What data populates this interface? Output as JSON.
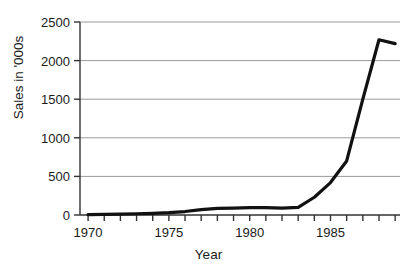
{
  "chart_data": {
    "type": "line",
    "title": "",
    "xlabel": "Year",
    "ylabel": "Sales in '000s",
    "xlim": [
      1969.5,
      1989.3
    ],
    "ylim": [
      0,
      2500
    ],
    "grid": true,
    "legend": false,
    "y_ticks": [
      0,
      500,
      1000,
      1500,
      2000,
      2500
    ],
    "y_tick_labels": [
      "0",
      "500",
      "1000",
      "1500",
      "2000",
      "2500"
    ],
    "x_ticks": [
      1970,
      1971,
      1972,
      1973,
      1974,
      1975,
      1976,
      1977,
      1978,
      1979,
      1980,
      1981,
      1982,
      1983,
      1984,
      1985,
      1986,
      1987,
      1988,
      1989
    ],
    "x_tick_labels_shown": [
      "1970",
      "1975",
      "1980",
      "1985"
    ],
    "x_tick_labels_shown_at": [
      1970,
      1975,
      1980,
      1985
    ],
    "line_color": "#111111",
    "line_width": 3.2,
    "grid_color": "#9a9a9a",
    "axis_color": "#333333",
    "x": [
      1970,
      1971,
      1972,
      1973,
      1974,
      1975,
      1976,
      1977,
      1978,
      1979,
      1980,
      1981,
      1982,
      1983,
      1984,
      1985,
      1986,
      1987,
      1988,
      1989
    ],
    "values": [
      5,
      8,
      12,
      16,
      22,
      30,
      45,
      70,
      85,
      90,
      95,
      95,
      90,
      100,
      230,
      420,
      700,
      1500,
      2270,
      2220
    ],
    "series": [
      {
        "name": "Sales",
        "values": [
          5,
          8,
          12,
          16,
          22,
          30,
          45,
          70,
          85,
          90,
          95,
          95,
          90,
          100,
          230,
          420,
          700,
          1500,
          2270,
          2220
        ]
      }
    ]
  }
}
